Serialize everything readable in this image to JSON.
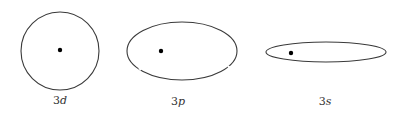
{
  "diagram": {
    "orbits": [
      {
        "id": "3d",
        "label_n": "3",
        "label_l": "d",
        "shape": "circle",
        "center": [
          60,
          51
        ],
        "rx": 39,
        "ry": 39,
        "nucleus": [
          60,
          50
        ],
        "label_pos": [
          60,
          104
        ]
      },
      {
        "id": "3p",
        "label_n": "3",
        "label_l": "p",
        "shape": "ellipse",
        "center": [
          182,
          51
        ],
        "rx": 55,
        "ry": 29,
        "nucleus": [
          161,
          51
        ],
        "label_pos": [
          178,
          105
        ]
      },
      {
        "id": "3s",
        "label_n": "3",
        "label_l": "s",
        "shape": "ellipse",
        "center": [
          326,
          52
        ],
        "rx": 60,
        "ry": 10,
        "nucleus": [
          291,
          53
        ],
        "label_pos": [
          325,
          105
        ]
      }
    ],
    "colors": {
      "outline": "#3a3a3a",
      "nucleus": "#000000",
      "label": "#333333"
    }
  }
}
